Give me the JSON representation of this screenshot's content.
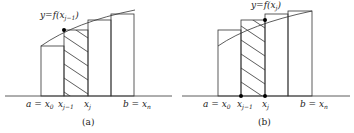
{
  "panels": [
    {
      "id": "a",
      "caption": "(a)",
      "curve_label": "y=f(x",
      "curve_label_sub": "j−1",
      "curve_label_close": ")",
      "x_labels": [
        {
          "main": "a = x",
          "sub": "0"
        },
        {
          "main": "x",
          "sub": "j−1"
        },
        {
          "main": "x",
          "sub": "j"
        },
        {
          "main": "b = x",
          "sub": "n"
        }
      ],
      "rule": "left endpoint"
    },
    {
      "id": "b",
      "caption": "(b)",
      "curve_label": "y=f(x",
      "curve_label_sub": "j",
      "curve_label_close": ")",
      "x_labels": [
        {
          "main": "a = x",
          "sub": "0"
        },
        {
          "main": "x",
          "sub": "j−1"
        },
        {
          "main": "x",
          "sub": "j"
        },
        {
          "main": "b = x",
          "sub": "n"
        }
      ],
      "rule": "right endpoint"
    }
  ],
  "colors": {
    "line": "#333333",
    "dot": "#000000",
    "background": "#ffffff"
  }
}
